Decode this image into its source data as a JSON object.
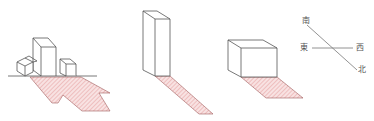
{
  "caption": {
    "text": "",
    "clipped": true
  },
  "figures": [
    {
      "id": "cluster",
      "description": "group of buildings with shadow"
    },
    {
      "id": "tower",
      "description": "tall building with long shadow"
    },
    {
      "id": "cube",
      "description": "low wide building with short shadow"
    }
  ],
  "compass": {
    "south": "南",
    "east": "東",
    "west": "西",
    "north": "北"
  },
  "colors": {
    "outline": "#555555",
    "shadow_fill": "#f6dcdc",
    "shadow_hatch": "#e49a9a",
    "compass_line": "#777777"
  }
}
